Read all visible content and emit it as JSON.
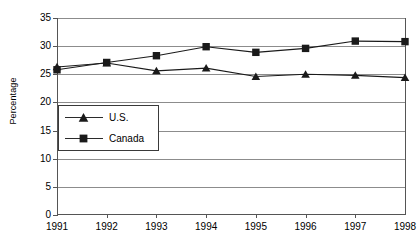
{
  "chart_data": {
    "type": "line",
    "title": "",
    "xlabel": "",
    "ylabel": "Percentage",
    "categories": [
      "1991",
      "1992",
      "1993",
      "1994",
      "1995",
      "1996",
      "1997",
      "1998"
    ],
    "ylim": [
      0,
      35
    ],
    "yticks": [
      "0",
      "5",
      "10",
      "15",
      "20",
      "25",
      "30",
      "35"
    ],
    "grid": true,
    "legend_position": "inside-lower-left",
    "series": [
      {
        "name": "U.S.",
        "marker": "triangle",
        "color": "#1a1a1a",
        "values": [
          26.3,
          27.0,
          25.6,
          26.1,
          24.6,
          25.0,
          24.8,
          24.4
        ]
      },
      {
        "name": "Canada",
        "marker": "square",
        "color": "#1a1a1a",
        "values": [
          25.8,
          27.1,
          28.3,
          29.9,
          28.9,
          29.6,
          30.9,
          30.8
        ]
      }
    ]
  }
}
